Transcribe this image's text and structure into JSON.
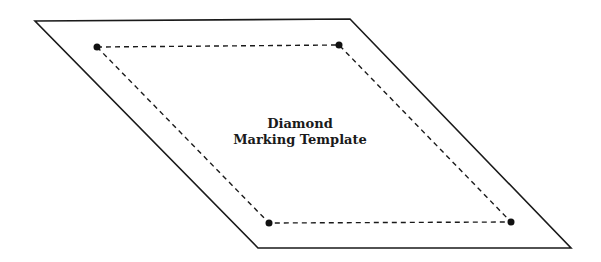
{
  "title_line1": "Diamond",
  "title_line2": "Marking Template",
  "colors": {
    "stroke": "#1a1a1a",
    "background": "#ffffff"
  },
  "outer_shape": {
    "type": "parallelogram",
    "points": [
      [
        35,
        21
      ],
      [
        350,
        19
      ],
      [
        571,
        248
      ],
      [
        258,
        248
      ]
    ]
  },
  "inner_shape": {
    "type": "dashed-parallelogram",
    "points": [
      [
        97,
        47
      ],
      [
        339,
        45
      ],
      [
        511,
        222
      ],
      [
        269,
        223
      ]
    ]
  },
  "markers": [
    "corner-dot-top-left",
    "corner-dot-top-right",
    "corner-dot-bottom-right",
    "corner-dot-bottom-left"
  ]
}
